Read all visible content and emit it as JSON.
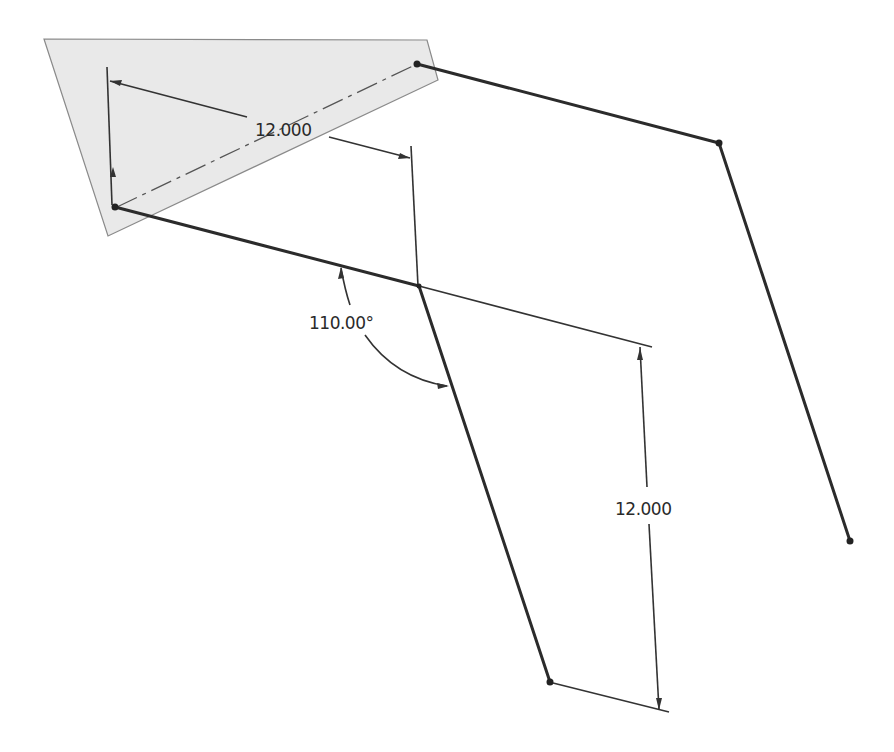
{
  "view": {
    "type": "CAD 3D sketch",
    "background": "#ffffff",
    "plane_color": "#e9e9e9",
    "line_color": "#2b2b2b"
  },
  "dimensions": {
    "top_length": "12.000",
    "angle": "110.00°",
    "right_length": "12.000"
  },
  "sketch": {
    "segments": [
      {
        "name": "segment-left-lower",
        "from": [
          115,
          207
        ],
        "to": [
          419,
          286
        ]
      },
      {
        "name": "segment-lower-diagonal",
        "from": [
          419,
          286
        ],
        "to": [
          550,
          682
        ]
      },
      {
        "name": "segment-upper",
        "from": [
          417,
          64
        ],
        "to": [
          719,
          143
        ]
      },
      {
        "name": "segment-right-diagonal",
        "from": [
          719,
          143
        ],
        "to": [
          850,
          541
        ]
      }
    ],
    "points": [
      [
        115,
        207
      ],
      [
        417,
        64
      ],
      [
        719,
        143
      ],
      [
        850,
        541
      ],
      [
        550,
        682
      ],
      [
        419,
        286
      ]
    ]
  }
}
